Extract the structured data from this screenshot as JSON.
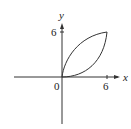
{
  "diagram": {
    "axes": {
      "x_label": "x",
      "y_label": "y",
      "origin_label": "0",
      "x_tick_label": "6",
      "y_tick_label": "6"
    },
    "curves": [
      {
        "name": "upper-curve",
        "description": "concave curve from (0,0) to (6,6)"
      },
      {
        "name": "lower-curve",
        "description": "convex curve from (0,0) to (6,6)"
      }
    ],
    "intersection_points": [
      [
        0,
        0
      ],
      [
        6,
        6
      ]
    ],
    "stroke_color": "#333333"
  }
}
